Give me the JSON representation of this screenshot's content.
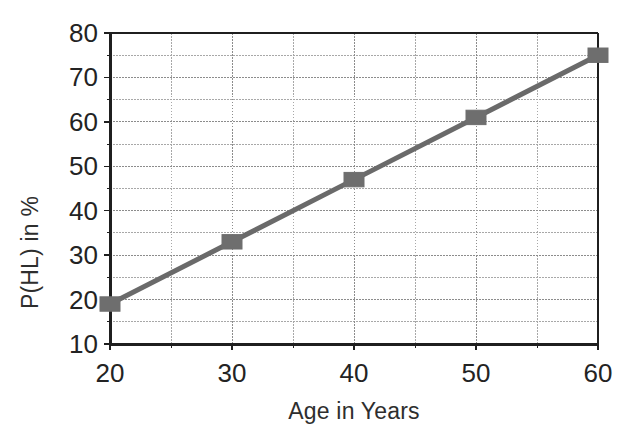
{
  "chart_data": {
    "type": "line",
    "title": "",
    "xlabel": "Age in Years",
    "ylabel": "P(HL) in %",
    "x": [
      20,
      30,
      40,
      50,
      60
    ],
    "values": [
      19,
      33,
      47,
      61,
      75
    ],
    "series": [
      {
        "name": "P(HL)",
        "x": [
          20,
          30,
          40,
          50,
          60
        ],
        "values": [
          19,
          33,
          47,
          61,
          75
        ],
        "color": "#6a6a6a",
        "marker": "square",
        "marker_color": "#6e6e6e"
      }
    ],
    "xlim": [
      20,
      60
    ],
    "ylim": [
      10,
      80
    ],
    "x_major_ticks": [
      20,
      30,
      40,
      50,
      60
    ],
    "x_minor_ticks": [
      25,
      35,
      45,
      55
    ],
    "y_major_ticks": [
      10,
      20,
      30,
      40,
      50,
      60,
      70,
      80
    ],
    "y_minor_ticks": [
      15,
      25,
      35,
      45,
      55,
      65,
      75
    ],
    "x_tick_labels": [
      "20",
      "30",
      "40",
      "50",
      "60"
    ],
    "y_tick_labels": [
      "10",
      "20",
      "30",
      "40",
      "50",
      "60",
      "70",
      "80"
    ],
    "grid": true,
    "grid_style": "dotted",
    "legend": false,
    "legend_position": "none"
  },
  "axis_colors": {
    "axis_line": "#1f1f1f",
    "major_grid": "#8c8c8c",
    "minor_grid": "#a8a8a8",
    "plot_background": "#ffffff",
    "series_line": "#6a6a6a",
    "marker_fill": "#6e6e6e"
  },
  "geometry": {
    "plot_left": 110,
    "plot_right": 598,
    "plot_top": 33,
    "plot_bottom": 344
  }
}
